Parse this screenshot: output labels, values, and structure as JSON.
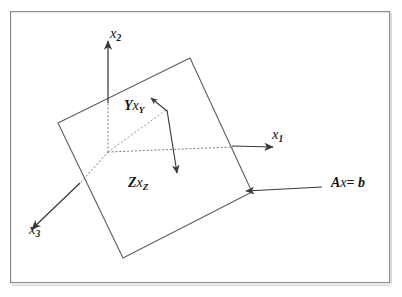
{
  "figure": {
    "type": "geometric-diagram",
    "background_color": "#ffffff",
    "ink_color": "#3a3a3a",
    "text_color": "#141414",
    "frame": {
      "name": "figure-border",
      "x": 10,
      "y": 11,
      "width": 380,
      "height": 272,
      "stroke": "#8a8a8a",
      "stroke_width": 1.2
    },
    "axes": [
      {
        "id": "x1",
        "label": "x",
        "subscript": "1",
        "solid_from": [
          232,
          146
        ],
        "solid_to": [
          272,
          147
        ],
        "dotted_from": [
          108,
          152
        ],
        "dotted_to": [
          232,
          147
        ],
        "label_pos": [
          272,
          127
        ]
      },
      {
        "id": "x2",
        "label": "x",
        "subscript": "2",
        "solid_from": [
          108,
          103
        ],
        "solid_to": [
          108,
          41
        ],
        "dotted_from": [
          108,
          152
        ],
        "dotted_to": [
          108,
          103
        ],
        "label_pos": [
          110,
          26
        ]
      },
      {
        "id": "x3",
        "label": "x",
        "subscript": "3",
        "solid_from": [
          80,
          183
        ],
        "solid_to": [
          33,
          228
        ],
        "dotted_from": [
          108,
          152
        ],
        "dotted_to": [
          80,
          183
        ],
        "label_pos": [
          29,
          222
        ]
      }
    ],
    "vectors": [
      {
        "id": "Yx_Y",
        "label": "Y",
        "var": "x",
        "subscript": "Y",
        "from": [
          167,
          110
        ],
        "to": [
          152,
          99
        ],
        "label_pos": [
          124,
          99
        ]
      },
      {
        "id": "Zx_Z",
        "label": "Z",
        "var": "x",
        "subscript": "Z",
        "from": [
          167,
          110
        ],
        "to": [
          177,
          172
        ],
        "label_pos": [
          128,
          176
        ]
      }
    ],
    "annotation": {
      "id": "Ax-equals-b",
      "matrix": "A",
      "var": "x",
      "operator": "=",
      "rhs": "b",
      "text": "Ax= b",
      "pointer_from": [
        322,
        187
      ],
      "pointer_to": [
        247,
        191
      ],
      "label_pos": [
        331,
        176
      ]
    },
    "plane": {
      "id": "solution-plane",
      "vertices": [
        [
          190,
          58
        ],
        [
          252,
          192
        ],
        [
          123,
          258
        ],
        [
          58,
          123
        ]
      ],
      "stroke": "#5e5e5e",
      "stroke_width": 1.1,
      "fill": "none"
    }
  }
}
